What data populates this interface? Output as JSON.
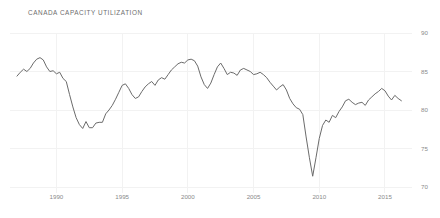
{
  "chart": {
    "title": "CANADA CAPACITY UTILIZATION"
  },
  "chart_data": {
    "type": "line",
    "title": "CANADA CAPACITY UTILIZATION",
    "xlabel": "",
    "ylabel": "",
    "xlim": [
      1987.0,
      2016.6
    ],
    "ylim": [
      70,
      90
    ],
    "grid": true,
    "legend": false,
    "line_color": "#6b6b6b",
    "grid_color": "#f2f2f2",
    "tick_color": "#8a8a8a",
    "title_color": "#6d6d6d",
    "background": "#ffffff",
    "xticks": [
      1990,
      1995,
      2000,
      2005,
      2010,
      2015
    ],
    "xtick_labels": [
      "1990",
      "1995",
      "2000",
      "2005",
      "2010",
      "2015"
    ],
    "yticks": [
      70,
      75,
      80,
      85,
      90
    ],
    "ytick_labels": [
      "70",
      "75",
      "80",
      "85",
      "90"
    ],
    "series": [
      {
        "name": "Canada Capacity Utilization",
        "x": [
          1987.0,
          1987.25,
          1987.5,
          1987.75,
          1988.0,
          1988.25,
          1988.5,
          1988.75,
          1989.0,
          1989.25,
          1989.5,
          1989.75,
          1990.0,
          1990.25,
          1990.5,
          1990.75,
          1991.0,
          1991.25,
          1991.5,
          1991.75,
          1992.0,
          1992.25,
          1992.5,
          1992.75,
          1993.0,
          1993.25,
          1993.5,
          1993.75,
          1994.0,
          1994.25,
          1994.5,
          1994.75,
          1995.0,
          1995.25,
          1995.5,
          1995.75,
          1996.0,
          1996.25,
          1996.5,
          1996.75,
          1997.0,
          1997.25,
          1997.5,
          1997.75,
          1998.0,
          1998.25,
          1998.5,
          1998.75,
          1999.0,
          1999.25,
          1999.5,
          1999.75,
          2000.0,
          2000.25,
          2000.5,
          2000.75,
          2001.0,
          2001.25,
          2001.5,
          2001.75,
          2002.0,
          2002.25,
          2002.5,
          2002.75,
          2003.0,
          2003.25,
          2003.5,
          2003.75,
          2004.0,
          2004.25,
          2004.5,
          2004.75,
          2005.0,
          2005.25,
          2005.5,
          2005.75,
          2006.0,
          2006.25,
          2006.5,
          2006.75,
          2007.0,
          2007.25,
          2007.5,
          2007.75,
          2008.0,
          2008.25,
          2008.5,
          2008.75,
          2009.0,
          2009.25,
          2009.5,
          2009.75,
          2010.0,
          2010.25,
          2010.5,
          2010.75,
          2011.0,
          2011.25,
          2011.5,
          2011.75,
          2012.0,
          2012.25,
          2012.5,
          2012.75,
          2013.0,
          2013.25,
          2013.5,
          2013.75,
          2014.0,
          2014.25,
          2014.5,
          2014.75,
          2015.0,
          2015.25,
          2015.5,
          2015.75,
          2016.0,
          2016.25
        ],
        "values": [
          84.4,
          84.9,
          85.3,
          85.0,
          85.4,
          86.1,
          86.6,
          86.8,
          86.5,
          85.6,
          85.0,
          85.1,
          84.7,
          84.9,
          84.1,
          83.7,
          82.0,
          80.4,
          79.0,
          78.1,
          77.6,
          78.5,
          77.7,
          77.7,
          78.3,
          78.4,
          78.4,
          79.5,
          80.0,
          80.6,
          81.4,
          82.3,
          83.2,
          83.4,
          82.8,
          82.0,
          81.5,
          81.7,
          82.4,
          83.0,
          83.4,
          83.7,
          83.2,
          83.9,
          84.2,
          84.0,
          84.6,
          85.2,
          85.6,
          86.0,
          86.2,
          86.1,
          86.5,
          86.6,
          86.4,
          85.7,
          84.3,
          83.3,
          82.8,
          83.5,
          84.6,
          85.6,
          86.1,
          85.4,
          84.6,
          84.9,
          84.8,
          84.5,
          85.2,
          85.4,
          85.2,
          85.0,
          84.6,
          84.7,
          84.9,
          84.6,
          84.2,
          83.6,
          83.1,
          82.6,
          83.0,
          83.3,
          82.6,
          81.5,
          80.8,
          80.3,
          80.1,
          79.4,
          76.5,
          73.8,
          71.4,
          73.8,
          76.3,
          78.0,
          78.7,
          78.4,
          79.3,
          79.0,
          79.8,
          80.4,
          81.2,
          81.4,
          81.0,
          80.7,
          80.9,
          81.0,
          80.6,
          81.3,
          81.7,
          82.1,
          82.4,
          82.8,
          82.5,
          81.8,
          81.3,
          81.9,
          81.5,
          81.2
        ]
      }
    ]
  }
}
